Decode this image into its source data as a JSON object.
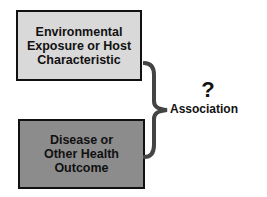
{
  "diagram": {
    "top_box": {
      "lines": [
        "Environmental",
        "Exposure or Host",
        "Characteristic"
      ],
      "fill": "#d9d9d9"
    },
    "bottom_box": {
      "lines": [
        "Disease or",
        "Other Health",
        "Outcome"
      ],
      "fill": "#8c8c8c"
    },
    "connector": {
      "symbol": "?",
      "label": "Association",
      "brace_color": "#444444"
    }
  }
}
